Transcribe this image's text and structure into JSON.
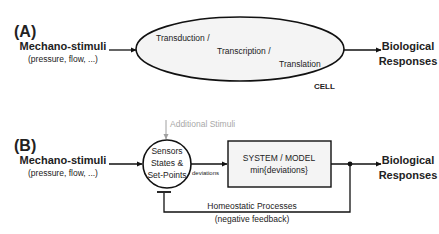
{
  "panel_a": {
    "label": "(A)",
    "input": {
      "title": "Mechano-stimuli",
      "subtitle": "(pressure, flow, ...)"
    },
    "cell": {
      "lines": [
        "Transduction /",
        "Transcription /",
        "Translation"
      ],
      "caption": "CELL"
    },
    "output": {
      "line1": "Biological",
      "line2": "Responses"
    }
  },
  "panel_b": {
    "label": "(B)",
    "input": {
      "title": "Mechano-stimuli",
      "subtitle": "(pressure, flow, ...)"
    },
    "additional_stimuli": "Additional Stimuli",
    "sensors": {
      "lines": [
        "Sensors",
        "States &",
        "Set-Points"
      ]
    },
    "edge_label": "deviations",
    "system": {
      "line1": "SYSTEM / MODEL",
      "line2": "min{deviations}"
    },
    "feedback": {
      "line1": "Homeostatic Processes",
      "line2": "(negative feedback)"
    },
    "output": {
      "line1": "Biological",
      "line2": "Responses"
    }
  },
  "colors": {
    "stroke": "#111111",
    "ellipse_fill": "#f4f4f4",
    "gray": "#a8a8a8"
  }
}
